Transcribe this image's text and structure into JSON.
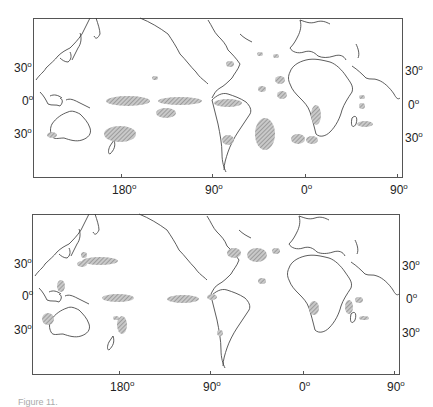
{
  "figure": {
    "panels": [
      {
        "id": "top",
        "frame": {
          "left": 33,
          "top": 18,
          "width": 370,
          "height": 160
        },
        "lat_labels_left": [
          {
            "text": "30",
            "deg": "o",
            "y": 65
          },
          {
            "text": "0",
            "deg": "o",
            "y": 98
          },
          {
            "text": "30",
            "deg": "o",
            "y": 131
          }
        ],
        "lat_labels_right": [
          {
            "text": "30",
            "deg": "o",
            "y": 68
          },
          {
            "text": "0",
            "deg": "o",
            "y": 102
          },
          {
            "text": "30",
            "deg": "o",
            "y": 135
          }
        ],
        "lon_labels": [
          {
            "text": "180",
            "deg": "o",
            "x": 121
          },
          {
            "text": "90",
            "deg": "o",
            "x": 212
          },
          {
            "text": "0",
            "deg": "o",
            "x": 305
          },
          {
            "text": "90",
            "deg": "o",
            "x": 397
          }
        ]
      },
      {
        "id": "bottom",
        "frame": {
          "left": 32,
          "top": 214,
          "width": 368,
          "height": 161
        },
        "lat_labels_left": [
          {
            "text": "30",
            "deg": "o",
            "y": 261
          },
          {
            "text": "0",
            "deg": "o",
            "y": 293
          },
          {
            "text": "30",
            "deg": "o",
            "y": 327
          }
        ],
        "lat_labels_right": [
          {
            "text": "30",
            "deg": "o",
            "y": 263
          },
          {
            "text": "0",
            "deg": "o",
            "y": 296
          },
          {
            "text": "30",
            "deg": "o",
            "y": 330
          }
        ],
        "lon_labels": [
          {
            "text": "180",
            "deg": "o",
            "x": 119
          },
          {
            "text": "90",
            "deg": "o",
            "x": 210
          },
          {
            "text": "0",
            "deg": "o",
            "x": 303
          },
          {
            "text": "90",
            "deg": "o",
            "x": 394
          }
        ]
      }
    ],
    "caption": "Figure 11.",
    "colors": {
      "coast": "#333333",
      "frame": "#555555",
      "hatch": "#8a8a8a"
    }
  }
}
